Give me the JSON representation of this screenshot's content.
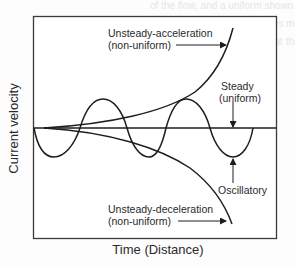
{
  "diagram": {
    "type": "velocity-vs-time-curves",
    "axes": {
      "x_label": "Time (Distance)",
      "y_label": "Current velocity"
    },
    "curves": [
      {
        "id": "acceleration",
        "label_line1": "Unsteady-acceleration",
        "label_line2": "(non-uniform)",
        "shape": "rising exponential"
      },
      {
        "id": "steady",
        "label_line1": "Steady",
        "label_line2": "(uniform)",
        "shape": "horizontal line"
      },
      {
        "id": "oscillatory",
        "label_line1": "Oscillatory",
        "shape": "sine wave"
      },
      {
        "id": "deceleration",
        "label_line1": "Unsteady-deceleration",
        "label_line2": "(non-uniform)",
        "shape": "falling exponential"
      }
    ],
    "colors": {
      "line": "#1e1e1e",
      "frame": "#3a3a3a",
      "background": "#fdfdfd"
    }
  },
  "background_text": [
    "of the flow, and a uniform shown in Figure",
    "action, the rate that the shows more strongly",
    "the which have respect to that the mode is"
  ]
}
